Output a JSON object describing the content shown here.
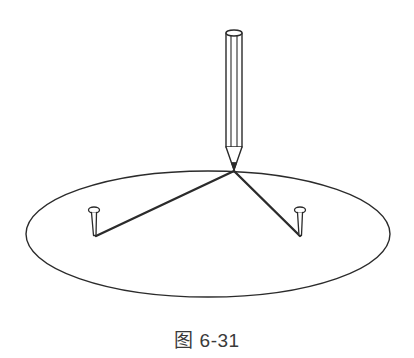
{
  "figure": {
    "caption": "图 6-31",
    "colors": {
      "stroke": "#2b2b2b",
      "background": "#ffffff"
    },
    "ellipse": {
      "cx": 208,
      "cy": 234,
      "rx": 182,
      "ry": 63
    },
    "pencil": {
      "x": 234,
      "top_y": 30,
      "body_bottom_y": 147,
      "tip_y": 170,
      "width": 16
    },
    "pins": [
      {
        "name": "left-pin",
        "head_x": 94,
        "head_y": 210,
        "point_x": 95,
        "point_y": 236
      },
      {
        "name": "right-pin",
        "head_x": 300,
        "head_y": 210,
        "point_x": 300,
        "point_y": 236
      }
    ],
    "string_junction": {
      "x": 234,
      "y": 171
    }
  }
}
